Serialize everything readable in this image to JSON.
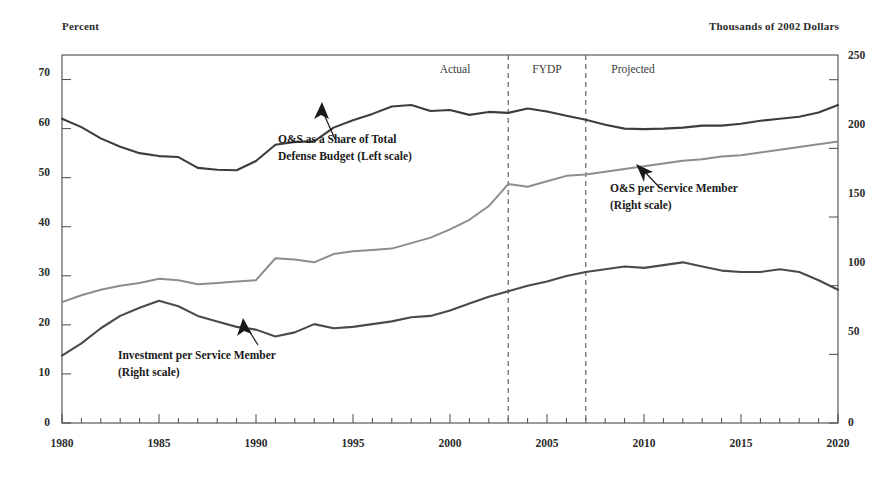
{
  "chart_data": {
    "type": "line",
    "title": "",
    "subtitle": "",
    "left_axis": {
      "label": "Percent",
      "ticks": [
        0,
        10,
        20,
        30,
        40,
        50,
        60,
        70
      ],
      "ylim": [
        0,
        75
      ]
    },
    "right_axis": {
      "label": "Thousands of 2002 Dollars",
      "ticks": [
        0,
        50,
        100,
        150,
        200,
        250
      ],
      "ylim": [
        0,
        268
      ]
    },
    "xlabel": "",
    "xticks": [
      1980,
      1985,
      1990,
      1995,
      2000,
      2005,
      2010,
      2015,
      2020
    ],
    "xlim": [
      1980,
      2020
    ],
    "grid": false,
    "legend_position": "inline-annotations",
    "regions": [
      {
        "label": "Actual",
        "start": 1980,
        "end": 2003
      },
      {
        "label": "FYDP",
        "start": 2003,
        "end": 2007
      },
      {
        "label": "Projected",
        "start": 2007,
        "end": 2020
      }
    ],
    "dividers": [
      2003,
      2007
    ],
    "annotations": [
      {
        "name": "os-share-annotation",
        "line1": "O&S as a Share of Total",
        "line2": "Defense Budget (Left scale)",
        "points_to_series": "O&S as a Share of Total Defense Budget"
      },
      {
        "name": "os-per-member-annotation",
        "line1": "O&S per Service Member",
        "line2": "(Right scale)",
        "points_to_series": "O&S per Service Member"
      },
      {
        "name": "investment-per-member-annotation",
        "line1": "Investment per Service Member",
        "line2": "(Right scale)",
        "points_to_series": "Investment per Service Member"
      }
    ],
    "x": [
      1980,
      1981,
      1982,
      1983,
      1984,
      1985,
      1986,
      1987,
      1988,
      1989,
      1990,
      1991,
      1992,
      1993,
      1994,
      1995,
      1996,
      1997,
      1998,
      1999,
      2000,
      2001,
      2002,
      2003,
      2004,
      2005,
      2006,
      2007,
      2008,
      2009,
      2010,
      2011,
      2012,
      2013,
      2014,
      2015,
      2016,
      2017,
      2018,
      2019,
      2020
    ],
    "series": [
      {
        "name": "O&S as a Share of Total Defense Budget",
        "axis": "left",
        "units": "percent",
        "color": "#3d3d3d",
        "values": [
          62.0,
          60.3,
          58.0,
          56.3,
          55.0,
          54.4,
          54.2,
          52.0,
          51.6,
          51.5,
          53.4,
          56.7,
          57.3,
          57.4,
          60.2,
          61.7,
          63.0,
          64.5,
          64.8,
          63.6,
          63.8,
          62.8,
          63.4,
          63.2,
          64.1,
          63.5,
          62.6,
          61.8,
          60.8,
          60.0,
          59.9,
          60.0,
          60.2,
          60.6,
          60.6,
          61.0,
          61.6,
          62.0,
          62.4,
          63.3,
          64.8
        ]
      },
      {
        "name": "O&S per Service Member",
        "axis": "right",
        "units": "thousands of 2002 dollars",
        "color": "#8d8d8d",
        "values": [
          88,
          93,
          97,
          100,
          102,
          105,
          104,
          101,
          102,
          103,
          104,
          120,
          119,
          117,
          123,
          125,
          126,
          127,
          131,
          135,
          141,
          148,
          158,
          174,
          172,
          176,
          180,
          181,
          183,
          185,
          187,
          189,
          191,
          192,
          194,
          195,
          197,
          199,
          201,
          203,
          205
        ]
      },
      {
        "name": "Investment per Service Member",
        "axis": "right",
        "units": "thousands of 2002 dollars",
        "color": "#4a4a4a",
        "values": [
          49,
          58,
          69,
          78,
          84,
          89,
          85,
          78,
          74,
          70,
          68,
          63,
          66,
          72,
          69,
          70,
          72,
          74,
          77,
          78,
          82,
          87,
          92,
          96,
          100,
          103,
          107,
          110,
          112,
          114,
          113,
          115,
          117,
          114,
          111,
          110,
          110,
          112,
          110,
          104,
          97
        ]
      }
    ]
  }
}
